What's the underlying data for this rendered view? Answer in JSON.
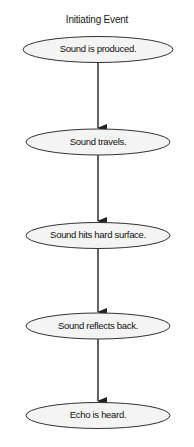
{
  "diagram": {
    "title": "Initiating Event",
    "type": "flowchart",
    "nodes": [
      {
        "id": "n1",
        "label": "Sound is produced.",
        "shape": "ellipse"
      },
      {
        "id": "n2",
        "label": "Sound travels.",
        "shape": "ellipse"
      },
      {
        "id": "n3",
        "label": "Sound hits hard surface.",
        "shape": "ellipse"
      },
      {
        "id": "n4",
        "label": "Sound reflects back.",
        "shape": "ellipse"
      },
      {
        "id": "n5",
        "label": "Echo is heard.",
        "shape": "ellipse"
      }
    ],
    "edges": [
      {
        "from": "n1",
        "to": "n2"
      },
      {
        "from": "n2",
        "to": "n3"
      },
      {
        "from": "n3",
        "to": "n4"
      },
      {
        "from": "n4",
        "to": "n5"
      }
    ],
    "colors": {
      "stroke": "#333333",
      "fill": "#f4f4f4",
      "text": "#111111"
    }
  }
}
